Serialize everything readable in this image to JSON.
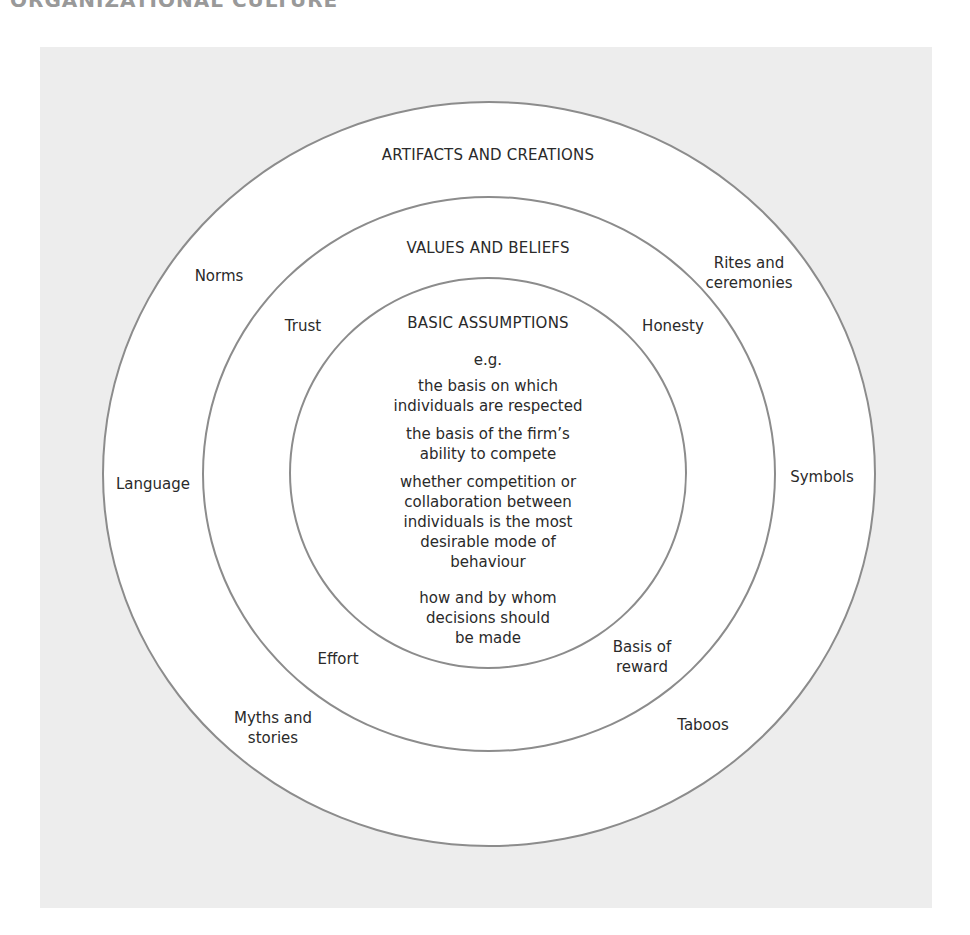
{
  "page_header": "ORGANIZATIONAL CULTURE",
  "colors": {
    "panel_bg": "#ededed",
    "ring_fill": "#ffffff",
    "ring_stroke": "#8c8c8c",
    "text": "#2a2a2a"
  },
  "outer_ring": {
    "title": "ARTIFACTS AND CREATIONS",
    "items": {
      "norms": "Norms",
      "rites_line1": "Rites and",
      "rites_line2": "ceremonies",
      "language": "Language",
      "symbols": "Symbols",
      "myths_line1": "Myths and",
      "myths_line2": "stories",
      "taboos": "Taboos"
    }
  },
  "middle_ring": {
    "title": "VALUES AND BELIEFS",
    "items": {
      "trust": "Trust",
      "honesty": "Honesty",
      "effort": "Effort",
      "reward_line1": "Basis of",
      "reward_line2": "reward"
    }
  },
  "inner_ring": {
    "title": "BASIC ASSUMPTIONS",
    "eg": "e.g.",
    "examples": [
      [
        "the basis on which",
        "individuals are respected"
      ],
      [
        "the basis of the firm’s",
        "ability to compete"
      ],
      [
        "whether competition or",
        "collaboration between",
        "individuals is the most",
        "desirable mode of",
        "behaviour"
      ],
      [
        "how and by whom",
        "decisions should",
        "be made"
      ]
    ]
  }
}
